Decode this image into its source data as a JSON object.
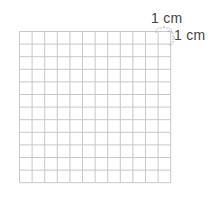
{
  "diagram": {
    "type": "grid-paper",
    "rows": 12,
    "columns": 12,
    "cell_size_px": 12.6,
    "line_color": "#c8c8c8",
    "labels": {
      "width_label": "1 cm",
      "height_label": "1 cm"
    }
  }
}
